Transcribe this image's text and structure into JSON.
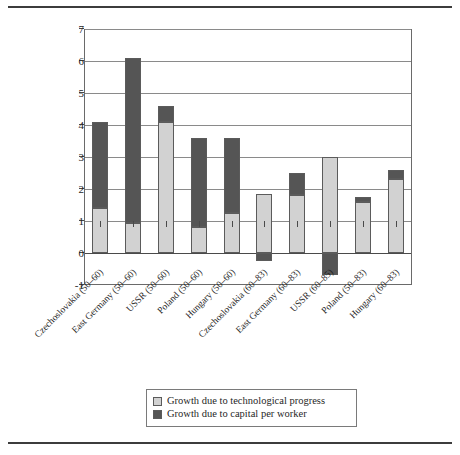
{
  "chart_data": {
    "type": "bar",
    "title": "",
    "subtitle": "",
    "xlabel": "",
    "ylabel": "",
    "stacked": true,
    "grid": true,
    "legend_position": "bottom",
    "ylim": [
      -1,
      7
    ],
    "yticks": [
      -1,
      0,
      1,
      2,
      3,
      4,
      5,
      6,
      7
    ],
    "ytick_labels": [
      "-1",
      "0",
      "1",
      "2",
      "3",
      "4",
      "5",
      "6",
      "7"
    ],
    "categories": [
      "Czechoslovakia (50–60)",
      "East Germany (50–60)",
      "USSR (50–60)",
      "Poland (50–60)",
      "Hungary (50–60)",
      "Czechoslovakia (60–83)",
      "East Germany (60–83)",
      "USSR (60–85)",
      "Poland (50–83)",
      "Hungary (60–83)"
    ],
    "series": [
      {
        "name": "Growth due to technological progress",
        "color": "#d2d2d2",
        "values": [
          1.4,
          0.95,
          4.1,
          0.8,
          1.25,
          1.85,
          1.8,
          3.0,
          1.6,
          2.3
        ]
      },
      {
        "name": "Growth due to capital per worker",
        "color": "#555555",
        "values": [
          2.7,
          5.15,
          0.5,
          2.8,
          2.35,
          -0.25,
          0.7,
          -0.7,
          0.15,
          0.3
        ]
      }
    ],
    "totals": [
      4.1,
      6.1,
      4.6,
      3.6,
      3.6,
      1.85,
      2.5,
      3.0,
      1.75,
      2.6
    ]
  },
  "legend": {
    "items": [
      {
        "label": "Growth due to technological progress",
        "swatch": "light"
      },
      {
        "label": "Growth due to capital per worker",
        "swatch": "dark"
      }
    ]
  }
}
